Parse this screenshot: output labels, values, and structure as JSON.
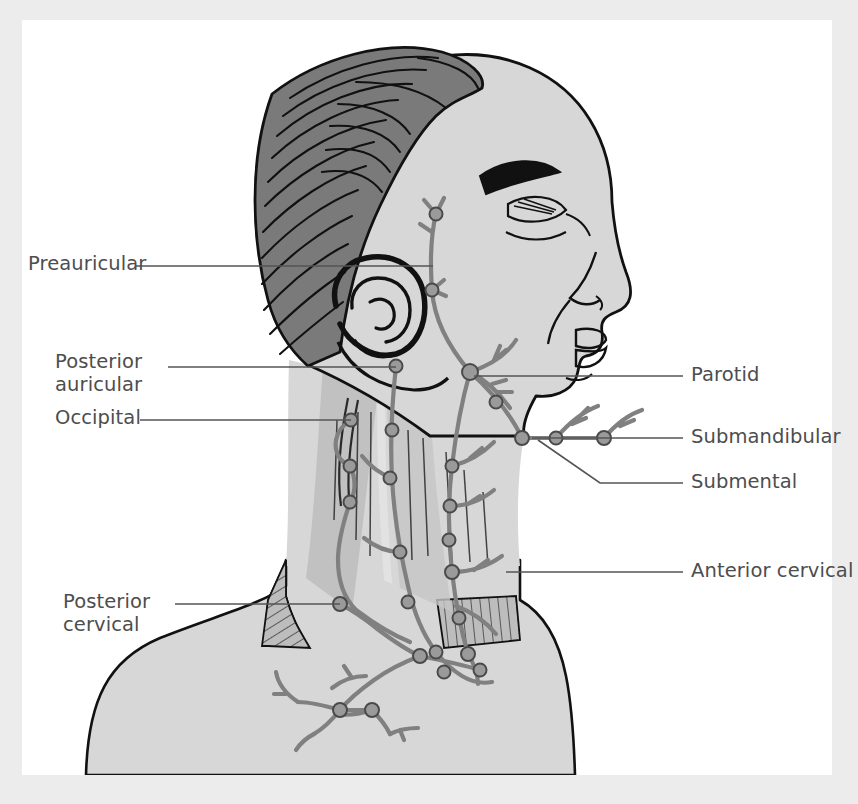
{
  "figure": {
    "view": "left lateral profile",
    "background_color": "#ececec",
    "plate_color": "#ffffff",
    "skin_color": "#d7d7d7",
    "hair_color": "#7a7a7a",
    "muscle_color": "#bdbdbd",
    "muscle_color_dark": "#b0b0b0",
    "lymph_color": "#808080",
    "node_color": "#9a9a9a",
    "outline_color": "#111111",
    "label_color": "#4d4d4d",
    "leader_color": "#555555"
  },
  "labels": [
    {
      "id": "preauricular",
      "text": "Preauricular",
      "side": "left",
      "x": 28,
      "y": 252,
      "lines": [
        "Preauricular"
      ]
    },
    {
      "id": "posterior-auricular",
      "text": "Posterior auricular",
      "side": "left",
      "x": 55,
      "y": 352,
      "lines": [
        "Posterior",
        "auricular"
      ]
    },
    {
      "id": "occipital",
      "text": "Occipital",
      "side": "left",
      "x": 55,
      "y": 408,
      "lines": [
        "Occipital"
      ]
    },
    {
      "id": "posterior-cervical",
      "text": "Posterior cervical",
      "side": "left",
      "x": 63,
      "y": 592,
      "lines": [
        "Posterior",
        "cervical"
      ]
    },
    {
      "id": "parotid",
      "text": "Parotid",
      "side": "right",
      "x": 690,
      "y": 365,
      "lines": [
        "Parotid"
      ]
    },
    {
      "id": "submandibular",
      "text": "Submandibular",
      "side": "right",
      "x": 690,
      "y": 427,
      "lines": [
        "Submandibular"
      ]
    },
    {
      "id": "submental",
      "text": "Submental",
      "side": "right",
      "x": 690,
      "y": 472,
      "lines": [
        "Submental"
      ]
    },
    {
      "id": "anterior-cervical",
      "text": "Anterior cervical",
      "side": "right",
      "x": 690,
      "y": 561,
      "lines": [
        "Anterior cervical"
      ]
    }
  ],
  "leaders": [
    {
      "id": "leader-preauricular",
      "points": "136,266 433,266"
    },
    {
      "id": "leader-posterior-auricular",
      "points": "168,367 396,367"
    },
    {
      "id": "leader-occipital",
      "points": "140,420 351,420"
    },
    {
      "id": "leader-posterior-cervical",
      "points": "175,604 340,604"
    },
    {
      "id": "leader-parotid",
      "points": "683,376 474,376"
    },
    {
      "id": "leader-submandibular",
      "points": "683,438 532,438"
    },
    {
      "id": "leader-submental",
      "points": "683,483 600,483 538,440"
    },
    {
      "id": "leader-anterior-cervical",
      "points": "683,572 506,572"
    }
  ],
  "node_groups": [
    {
      "id": "preauricular-nodes",
      "label": "Preauricular",
      "count": 2
    },
    {
      "id": "parotid-nodes",
      "label": "Parotid",
      "count": 2
    },
    {
      "id": "posterior-auricular-nodes",
      "label": "Posterior auricular",
      "count": 2
    },
    {
      "id": "occipital-nodes",
      "label": "Occipital",
      "count": 3
    },
    {
      "id": "submandibular-nodes",
      "label": "Submandibular",
      "count": 3
    },
    {
      "id": "submental-nodes",
      "label": "Submental",
      "count": 1
    },
    {
      "id": "anterior-cervical-nodes",
      "label": "Anterior cervical",
      "count": 6
    },
    {
      "id": "posterior-cervical-nodes",
      "label": "Posterior cervical",
      "count": 4
    },
    {
      "id": "supraclavicular-nodes",
      "label": "Supraclavicular",
      "count": 6
    }
  ]
}
